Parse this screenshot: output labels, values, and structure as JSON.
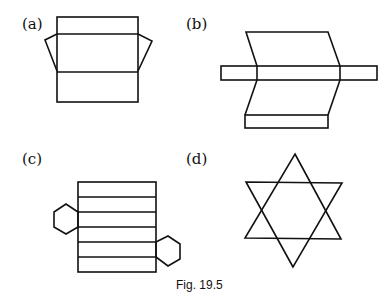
{
  "figure": {
    "caption": "Fig. 19.5",
    "panels": [
      {
        "label": "(a)",
        "description": "Net of a box: rectangular strips with two trapezoid side flaps"
      },
      {
        "label": "(b)",
        "description": "Net of a parallelogram prism with horizontal strip and bottom rectangle"
      },
      {
        "label": "(c)",
        "description": "Net of a hexagonal prism: six stacked rectangles with two hexagonal ends"
      },
      {
        "label": "(d)",
        "description": "Six-pointed star (hexagram)"
      }
    ]
  },
  "colors": {
    "stroke": "#111111",
    "background": "#ffffff"
  }
}
